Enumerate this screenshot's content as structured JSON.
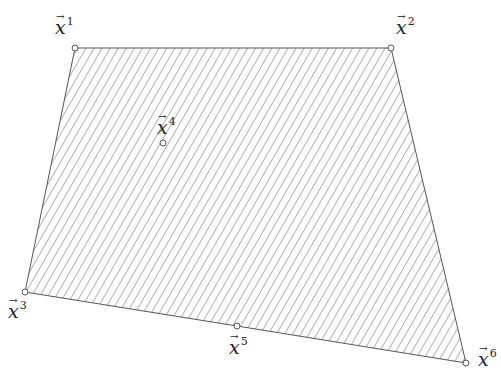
{
  "diagram": {
    "type": "polygon-hatched",
    "stroke_color": "#555555",
    "hatch_color": "#666666",
    "vertex_fill": "#ffffff",
    "polygon_vertices": [
      "x1",
      "x2",
      "x6",
      "x5",
      "x3"
    ],
    "points": [
      {
        "id": "x1",
        "base": "x",
        "index": "1",
        "x": 75,
        "y": 48,
        "label_x": 55,
        "label_y": 18
      },
      {
        "id": "x2",
        "base": "x",
        "index": "2",
        "x": 391,
        "y": 48,
        "label_x": 396,
        "label_y": 18
      },
      {
        "id": "x3",
        "base": "x",
        "index": "3",
        "x": 25,
        "y": 292,
        "label_x": 8,
        "label_y": 302
      },
      {
        "id": "x4",
        "base": "x",
        "index": "4",
        "x": 163,
        "y": 143,
        "label_x": 157,
        "label_y": 118
      },
      {
        "id": "x5",
        "base": "x",
        "index": "5",
        "x": 237,
        "y": 326,
        "label_x": 229,
        "label_y": 338
      },
      {
        "id": "x6",
        "base": "x",
        "index": "6",
        "x": 466,
        "y": 363,
        "label_x": 478,
        "label_y": 350
      }
    ]
  }
}
